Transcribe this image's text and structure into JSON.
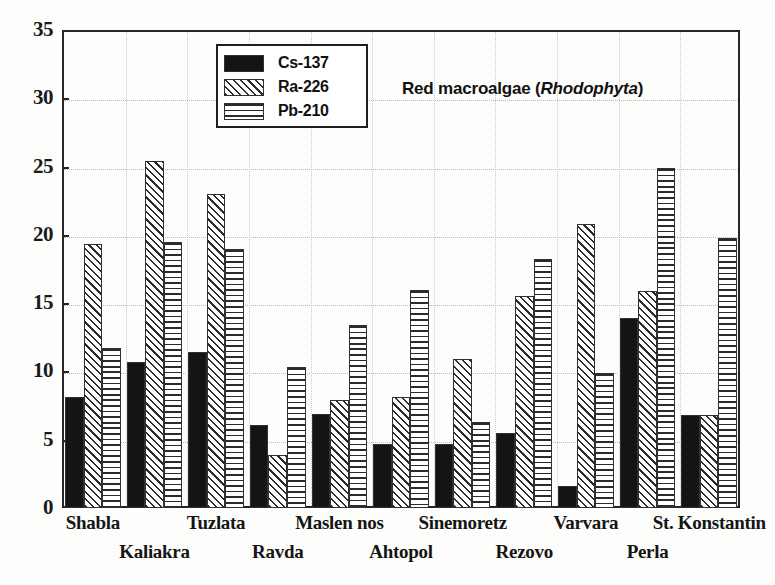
{
  "chart_data": {
    "type": "bar",
    "title_plain": "Red macroalgae (",
    "title_italic": "Rhodophyta",
    "title_tail": ")",
    "xlabel": "",
    "ylabel": "",
    "ylim": [
      0,
      35
    ],
    "yticks": [
      0,
      5,
      10,
      15,
      20,
      25,
      30,
      35
    ],
    "grid": true,
    "legend_position": "top-left-inside",
    "categories": [
      "Shabla",
      "Kaliakra",
      "Tuzlata",
      "Ravda",
      "Maslen nos",
      "Ahtopol",
      "Sinemoretz",
      "Rezovo",
      "Varvara",
      "Perla",
      "St. Konstantin"
    ],
    "series": [
      {
        "name": "Cs-137",
        "fill": "solid-black",
        "color": "#141414",
        "values": [
          8.1,
          10.7,
          11.4,
          6.1,
          6.9,
          4.7,
          4.7,
          5.5,
          1.6,
          13.9,
          6.8
        ]
      },
      {
        "name": "Ra-226",
        "fill": "diagonal-hatch",
        "color": "#2b2b2b",
        "values": [
          19.3,
          25.4,
          23.0,
          3.9,
          7.9,
          8.1,
          10.9,
          15.5,
          20.8,
          15.9,
          6.8
        ]
      },
      {
        "name": "Pb-210",
        "fill": "horizontal-hatch",
        "color": "#2b2b2b",
        "values": [
          11.7,
          19.5,
          19.0,
          10.3,
          13.4,
          16.0,
          6.3,
          18.2,
          9.9,
          24.9,
          19.8
        ]
      }
    ]
  },
  "axis": {
    "y_tick_labels": [
      "0",
      "5",
      "10",
      "15",
      "20",
      "25",
      "30",
      "35"
    ]
  },
  "legend": {
    "items": [
      {
        "label": "Cs-137"
      },
      {
        "label": "Ra-226"
      },
      {
        "label": "Pb-210"
      }
    ]
  }
}
